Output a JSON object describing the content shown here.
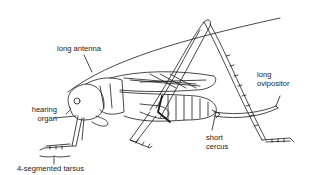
{
  "diagram": {
    "line_color": "#1a1a1a",
    "background": "#ffffff",
    "labels": [
      {
        "id": "long-antenna",
        "line1": "long antenna",
        "line2": ""
      },
      {
        "id": "hearing-organ",
        "line1": "hearing",
        "line2": "organ"
      },
      {
        "id": "tarsus",
        "line1": "4-segmented tarsus",
        "line2": ""
      },
      {
        "id": "ovipositor",
        "line1": "long",
        "line2": "ovipositor"
      },
      {
        "id": "cercus",
        "line1": "short",
        "line2": "cercus"
      }
    ]
  }
}
